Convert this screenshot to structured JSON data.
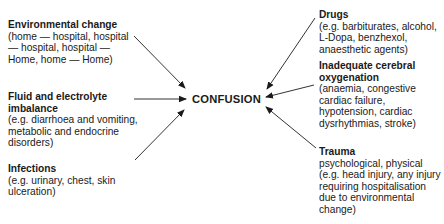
{
  "center": {
    "label": "CONFUSION"
  },
  "causes": {
    "environmental": {
      "title": "Environmental change",
      "desc": "(home — hospital, hospital — hospital, hospital — Home, home — Home)"
    },
    "fluid": {
      "title": "Fluid and electrolyte imbalance",
      "desc": "(e.g. diarrhoea and vomiting, metabolic and endocrine disorders)"
    },
    "infections": {
      "title": "Infections",
      "desc": "(e.g. urinary, chest, skin ulceration)"
    },
    "drugs": {
      "title": "Drugs",
      "desc": "(e.g. barbiturates, alcohol, L-Dopa, benzhexol, anaesthetic agents)"
    },
    "cerebral": {
      "title": "Inadequate cerebral oxygenation",
      "desc": "(anaemia, congestive cardiac failure, hypotension, cardiac dysrhythmias, stroke)"
    },
    "trauma": {
      "title": "Trauma",
      "desc": "psychological, physical (e.g. head injury, any injury requiring hospitalisation due to environmental change)"
    }
  },
  "colors": {
    "ink": "#1a1a1a",
    "arrow": "#333333"
  }
}
